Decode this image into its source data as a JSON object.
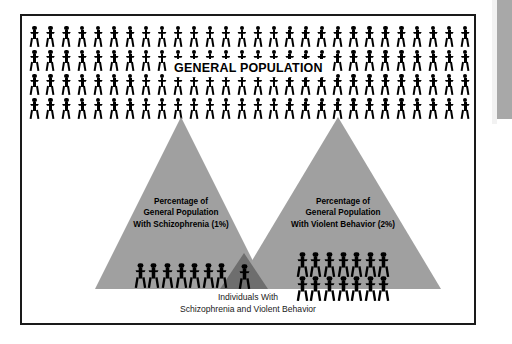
{
  "figure": {
    "general_population": {
      "label": "GENERAL POPULATION",
      "rows": 4,
      "per_row": 28,
      "figure_icon": "person-icon"
    },
    "left_triangle": {
      "label_line1": "Percentage of",
      "label_line2": "General Population",
      "label_line3": "With Schizophrenia (1%)",
      "percent": "1%",
      "figure_count": 7,
      "fill_color": "#a0a0a0"
    },
    "right_triangle": {
      "label_line1": "Percentage of",
      "label_line2": "General Population",
      "label_line3": "With Violent Behavior (2%)",
      "percent": "2%",
      "figure_count": 14,
      "rows": 2,
      "per_row": 7,
      "fill_color": "#a0a0a0"
    },
    "overlap": {
      "figure_count": 1,
      "fill_color": "#6e6e6e"
    },
    "caption_line1": "Individuals With",
    "caption_line2": "Schizophrenia and Violent Behavior",
    "border_color": "#1a1a1a",
    "background_color": "#ffffff",
    "figure_color": "#000000"
  }
}
